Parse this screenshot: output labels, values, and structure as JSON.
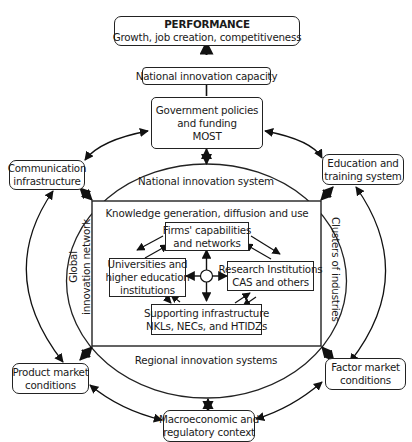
{
  "diagram": {
    "performance": {
      "title": "PERFORMANCE",
      "subtitle": "Growth, job creation, competitiveness"
    },
    "national_innovation_capacity": "National innovation capacity",
    "government": {
      "line1": "Government policies",
      "line2": "and funding",
      "line3": "MOST"
    },
    "communication": {
      "line1": "Communication",
      "line2": "infrastructure"
    },
    "education": {
      "line1": "Education and",
      "line2": "training system"
    },
    "product_market": {
      "line1": "Product market",
      "line2": "conditions"
    },
    "factor_market": {
      "line1": "Factor market",
      "line2": "conditions"
    },
    "macroeconomic": {
      "line1": "Macroeconomic and",
      "line2": "regulatory context"
    },
    "ellipse_labels": {
      "top": "National innovation system",
      "bottom": "Regional innovation systems",
      "left_line1": "Global",
      "left_line2": "innovation network",
      "right": "Clusters of industries"
    },
    "core": {
      "title": "Knowledge generation, diffusion and use",
      "firms": {
        "line1": "Firms' capabilities",
        "line2": "and networks"
      },
      "universities": {
        "line1": "Universities and",
        "line2": "higher education",
        "line3": "institutions"
      },
      "research": {
        "line1": "Research Institutions",
        "line2": "CAS and others"
      },
      "infrastructure": {
        "line1": "Supporting infrastructure",
        "line2": "NKLs, NECs, and HTIDZs"
      }
    }
  }
}
